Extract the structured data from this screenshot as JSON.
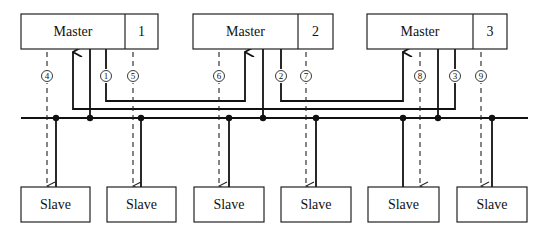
{
  "diagram": {
    "title": "",
    "masters": [
      {
        "label": "Master",
        "id": "1"
      },
      {
        "label": "Master",
        "id": "2"
      },
      {
        "label": "Master",
        "id": "3"
      }
    ],
    "slaves": [
      {
        "label": "Slave"
      },
      {
        "label": "Slave"
      },
      {
        "label": "Slave"
      },
      {
        "label": "Slave"
      },
      {
        "label": "Slave"
      },
      {
        "label": "Slave"
      }
    ],
    "step_markers": [
      "①",
      "②",
      "③",
      "④",
      "⑤",
      "⑥",
      "⑦",
      "⑧",
      "⑨"
    ],
    "edges": [
      {
        "from": "Master 1",
        "to": "Master 2",
        "marker": "①",
        "style": "solid"
      },
      {
        "from": "Master 2",
        "to": "Master 3",
        "marker": "②",
        "style": "solid"
      },
      {
        "from": "Master 3",
        "to": "Master 1",
        "marker": "③",
        "style": "solid"
      },
      {
        "from": "Master 1",
        "to": "Slave 1",
        "marker": "④",
        "style": "dashed"
      },
      {
        "from": "Master 1",
        "to": "Slave 2",
        "marker": "⑤",
        "style": "dashed"
      },
      {
        "from": "Master 2",
        "to": "Slave 3",
        "marker": "⑥",
        "style": "dashed"
      },
      {
        "from": "Master 2",
        "to": "Slave 4",
        "marker": "⑦",
        "style": "dashed"
      },
      {
        "from": "Master 3",
        "to": "Slave 5",
        "marker": "⑧",
        "style": "dashed"
      },
      {
        "from": "Master 3",
        "to": "Slave 6",
        "marker": "⑨",
        "style": "dashed"
      }
    ],
    "bus": "shared bus line connecting all masters and slaves"
  }
}
